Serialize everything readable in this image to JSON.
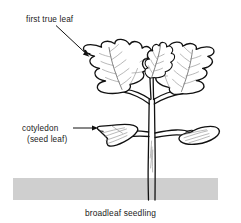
{
  "figure": {
    "background_color": "#ffffff",
    "ink_color": "#111111",
    "soil_color": "#cfcfcf",
    "vein_color": "#8a8a8a"
  },
  "labels": {
    "first_true_leaf": "first true leaf",
    "cotyledon": "cotyledon",
    "seed_leaf": "(seed leaf)"
  },
  "caption": {
    "text": "broadleaf seedling"
  },
  "annotations": [
    {
      "name": "first-true-leaf-callout",
      "label": "first true leaf",
      "text_position": [
        26,
        19
      ],
      "leader_from": [
        57,
        25
      ],
      "leader_to": [
        89,
        56
      ],
      "arrow": "diagonal-down-right"
    },
    {
      "name": "cotyledon-callout",
      "label": "cotyledon",
      "sublabel": "(seed leaf)",
      "text_position": [
        22,
        131
      ],
      "leader_from": [
        74,
        128
      ],
      "leader_to": [
        98,
        128
      ],
      "arrow": "horizontal-right"
    }
  ],
  "parts": {
    "soil_band": {
      "name": "soil-line",
      "x": 13,
      "y": 178,
      "width": 205,
      "height": 22,
      "color": "#cfcfcf"
    },
    "stem": {
      "name": "main-stem",
      "description": "central vertical stem rising from soil"
    },
    "true_leaves": {
      "count": 3,
      "description": "lobed first true leaves at top: left, center emerging, right"
    },
    "cotyledons": {
      "count": 2,
      "description": "smooth oval seed leaves at mid height: left and right"
    }
  }
}
